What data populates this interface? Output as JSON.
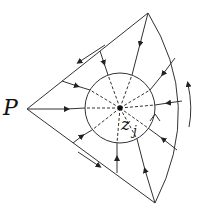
{
  "diagram": {
    "type": "flow-field-sector",
    "labels": {
      "vertex": "P",
      "center": "z",
      "center_subscript": "j"
    },
    "colors": {
      "stroke": "#333333",
      "background": "#ffffff"
    },
    "geometry": {
      "vertex_P": [
        27,
        109
      ],
      "top_corner": [
        148,
        13
      ],
      "bottom_corner": [
        155,
        203
      ],
      "center": [
        120,
        108
      ],
      "inner_circle_radius": 35
    },
    "elements": [
      "sector boundary from P with outer arc",
      "inner circle around z_j",
      "dashed radial lines from z_j to inner circle",
      "solid flow lines with inward arrowheads toward z_j",
      "counter-clockwise orientation arrows along boundary",
      "small chevron arrow on inner circle"
    ]
  }
}
